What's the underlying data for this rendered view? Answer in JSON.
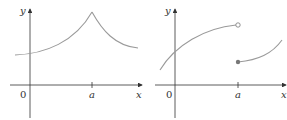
{
  "graphs": [
    {
      "id": "left",
      "labels": {
        "y_axis": "y",
        "x_axis": "x",
        "origin": "0",
        "tick_a": "a"
      },
      "description": "continuous function with a sharp corner (cusp) at x = a"
    },
    {
      "id": "right",
      "labels": {
        "y_axis": "y",
        "x_axis": "x",
        "origin": "0",
        "tick_a": "a"
      },
      "description": "jump discontinuity at x = a: open circle on left branch, filled dot on right branch"
    }
  ],
  "colors": {
    "axis": "#333333",
    "curve": "#9a9a9a",
    "background": "#ffffff"
  }
}
